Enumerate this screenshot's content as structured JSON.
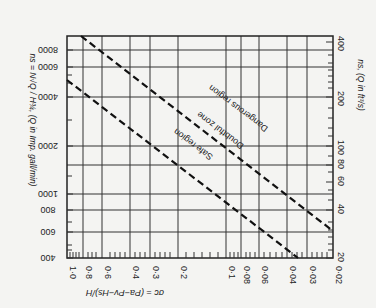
{
  "chart_data": {
    "type": "line",
    "orientation_note": "figure scanned rotated 180 degrees",
    "title": "",
    "xlabel": "σc = (Pa − Pv − Hs)/H",
    "ylabel_left": "ns = N√Q / H^(3/4), (Q in Imp. gall/min)",
    "ylabel_right": "ns, (Q in ft³/s)",
    "x_scale": "log",
    "y_scale": "log",
    "x_ticks": [
      "1·0",
      "0·8",
      "0·6",
      "0·4",
      "0·3",
      "0·2",
      "0·1",
      "0·08",
      "0·06",
      "0·04",
      "0·03",
      "0·02"
    ],
    "y_left_ticks": [
      "400",
      "600",
      "800",
      "1000",
      "2000",
      "4000",
      "6000",
      "8000"
    ],
    "y_right_ticks": [
      "20",
      "40",
      "60",
      "80",
      "100",
      "200",
      "400"
    ],
    "xlim": [
      1.0,
      0.02
    ],
    "ylim_left": [
      400,
      9000
    ],
    "ylim_right": [
      20,
      450
    ],
    "grid": true,
    "series": [
      {
        "name": "Upper boundary (Dangerous / Doubtful)",
        "style": "dashed",
        "points": [
          {
            "sigma": 0.85,
            "ns_left": 9000
          },
          {
            "sigma": 0.02,
            "ns_left": 600
          }
        ]
      },
      {
        "name": "Lower boundary (Doubtful / Safe)",
        "style": "dashed",
        "points": [
          {
            "sigma": 1.0,
            "ns_left": 5000
          },
          {
            "sigma": 0.028,
            "ns_left": 400
          }
        ]
      }
    ],
    "annotations": [
      "Dangerous region",
      "Doubtful zone",
      "Safe region"
    ]
  },
  "labels": {
    "x_axis_title": "σc = (Pa−Pv−Hs)/H",
    "y_left_title": "ns = N√Q / H¾, (Q in Imp. gall/min)",
    "y_right_title": "ns, (Q in ft³/s)",
    "region_dangerous": "Dangerous region",
    "region_doubtful": "Doubtful zone",
    "region_safe": "Safe region"
  },
  "ticks": {
    "x": [
      {
        "label": "1·0",
        "x": 67
      },
      {
        "label": "0·8",
        "x": 83
      },
      {
        "label": "0·6",
        "x": 102
      },
      {
        "label": "0·4",
        "x": 130
      },
      {
        "label": "0·3",
        "x": 150
      },
      {
        "label": "0·2",
        "x": 178
      },
      {
        "label": "0·1",
        "x": 226
      },
      {
        "label": "0·08",
        "x": 241
      },
      {
        "label": "0·06",
        "x": 259
      },
      {
        "label": "0·04",
        "x": 287
      },
      {
        "label": "0·03",
        "x": 307
      },
      {
        "label": "0·02",
        "x": 333
      }
    ],
    "y_left": [
      {
        "label": "8000",
        "y": 50
      },
      {
        "label": "6000",
        "y": 67
      },
      {
        "label": "4000",
        "y": 97
      },
      {
        "label": "2000",
        "y": 146
      },
      {
        "label": "1000",
        "y": 194
      },
      {
        "label": "800",
        "y": 210
      },
      {
        "label": "600",
        "y": 232
      },
      {
        "label": "400",
        "y": 258
      }
    ],
    "y_right": [
      {
        "label": "400",
        "y": 42
      },
      {
        "label": "200",
        "y": 97
      },
      {
        "label": "100",
        "y": 146
      },
      {
        "label": "80",
        "y": 165
      },
      {
        "label": "60",
        "y": 182
      },
      {
        "label": "40",
        "y": 210
      },
      {
        "label": "20",
        "y": 258
      }
    ]
  },
  "lines": {
    "upper": {
      "x1": 81,
      "y1": 36,
      "x2": 333,
      "y2": 231
    },
    "lower": {
      "x1": 67,
      "y1": 80,
      "x2": 298,
      "y2": 258
    }
  }
}
